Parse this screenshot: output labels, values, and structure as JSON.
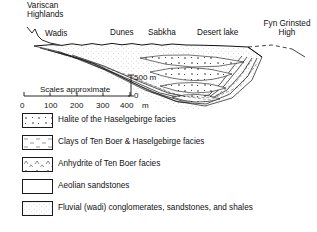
{
  "figure": {
    "type": "geological-cross-section",
    "annotations": [
      {
        "id": "variscan",
        "line1": "Variscan",
        "line2": "Highlands"
      },
      {
        "id": "wadis",
        "label": "Wadis"
      },
      {
        "id": "dunes",
        "label": "Dunes"
      },
      {
        "id": "sabkha",
        "label": "Sabkha"
      },
      {
        "id": "desert_lake",
        "label": "Desert lake"
      },
      {
        "id": "fyn_grinsted_high",
        "line1": "Fyn Grinsted",
        "line2": "High"
      }
    ],
    "labels": {
      "variscan_line1": "Variscan",
      "variscan_line2": "Highlands",
      "wadis": "Wadis",
      "dunes": "Dunes",
      "sabkha": "Sabkha",
      "desert_lake": "Desert lake",
      "fyn_line1": "Fyn Grinsted",
      "fyn_line2": "High"
    }
  },
  "scale": {
    "note": "Scales approximate",
    "vertical_top": "500 m",
    "vertical_bottom": "0",
    "horizontal_ticks": [
      "0",
      "100",
      "200",
      "300",
      "400"
    ],
    "horizontal_unit": "m"
  },
  "legend": {
    "items": [
      {
        "pattern": "halite-dots",
        "label": "Halite of the Haselgebirge facies"
      },
      {
        "pattern": "clay-dashes",
        "label": "Clays of Ten Boer & Haselgebirge facies"
      },
      {
        "pattern": "anhydrite-carets",
        "label": "Anhydrite of Ten Boer facies"
      },
      {
        "pattern": "blank-white",
        "label": "Aeolian sandstones"
      },
      {
        "pattern": "stipple-grey",
        "label": "Fluvial (wadi) conglomerates, sandstones, and shales"
      }
    ]
  },
  "colors": {
    "ink": "#111111",
    "paper": "#ffffff",
    "stipple": "#f0f0f0"
  }
}
